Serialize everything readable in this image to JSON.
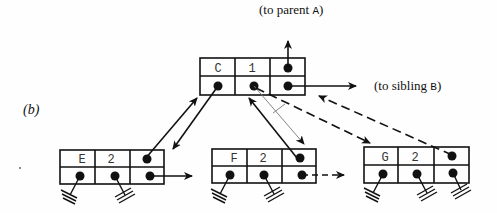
{
  "figure": {
    "panel_label_open": "(",
    "panel_label": "b",
    "panel_label_close": ")",
    "parent_label_prefix": "(to parent ",
    "parent_label_name": "A",
    "parent_label_suffix": ")",
    "sibling_label_prefix": "(to sibling ",
    "sibling_label_name": "B",
    "sibling_label_suffix": ")"
  },
  "nodes": [
    {
      "id": "C",
      "key": "C",
      "count": "1"
    },
    {
      "id": "E",
      "key": "E",
      "count": "2"
    },
    {
      "id": "F",
      "key": "F",
      "count": "2"
    },
    {
      "id": "G",
      "key": "G",
      "count": "2"
    }
  ],
  "colors": {
    "ink": "#111111",
    "thin_line": "#777777"
  }
}
